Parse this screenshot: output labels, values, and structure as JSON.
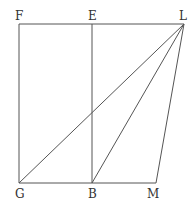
{
  "diagram": {
    "line_color": "#555555",
    "label_color": "#333333",
    "points": {
      "F": {
        "label": "F",
        "x": 19,
        "y": 24
      },
      "E": {
        "label": "E",
        "x": 92,
        "y": 24
      },
      "L": {
        "label": "L",
        "x": 184,
        "y": 24
      },
      "G": {
        "label": "G",
        "x": 19,
        "y": 183
      },
      "B": {
        "label": "B",
        "x": 92,
        "y": 183
      },
      "M": {
        "label": "M",
        "x": 156,
        "y": 183
      }
    },
    "segments": [
      [
        "F",
        "L"
      ],
      [
        "F",
        "G"
      ],
      [
        "E",
        "B"
      ],
      [
        "G",
        "M"
      ],
      [
        "G",
        "L"
      ],
      [
        "B",
        "L"
      ],
      [
        "M",
        "L"
      ]
    ],
    "labels": {
      "F": "F",
      "E": "E",
      "L": "L",
      "G": "G",
      "B": "B",
      "M": "M"
    }
  }
}
